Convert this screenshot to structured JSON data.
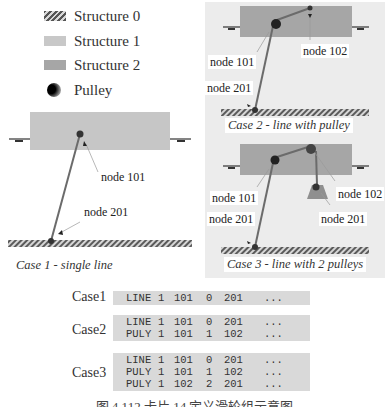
{
  "legend": {
    "items": [
      {
        "label": "Structure 0",
        "icon": "hatched-ground-swatch"
      },
      {
        "label": "Structure 1",
        "icon": "light-gray-swatch"
      },
      {
        "label": "Structure 2",
        "icon": "dark-gray-swatch"
      },
      {
        "label": "Pulley",
        "icon": "pulley-sphere-icon"
      }
    ]
  },
  "case1": {
    "title": "Case 1 - single line",
    "labels": {
      "node_top": "node 101",
      "node_bottom": "node 201"
    }
  },
  "case2": {
    "title": "Case 2 - line with pulley",
    "labels": {
      "node_pulley": "node 101",
      "node_end": "node 102",
      "node_bottom": "node 201"
    }
  },
  "case3": {
    "title": "Case 3 - line with 2 pulleys",
    "labels": {
      "node_pulley1": "node 101",
      "node_pulley2": "node 102",
      "node_bottom": "node 201",
      "node_weight": "node 201"
    }
  },
  "colors": {
    "structure1": "#c8c8c8",
    "structure2": "#a6a6a6",
    "panel_bg": "#ececec",
    "line": "#6b6b6b",
    "code_bg": "#d9d9d9"
  },
  "code_cases": [
    {
      "label": "Case1",
      "rows": [
        [
          "LINE",
          "1",
          "101",
          "0",
          "201",
          "..."
        ]
      ]
    },
    {
      "label": "Case2",
      "rows": [
        [
          "LINE",
          "1",
          "101",
          "0",
          "201",
          "..."
        ],
        [
          "PULY",
          "1",
          "101",
          "1",
          "102",
          "..."
        ]
      ]
    },
    {
      "label": "Case3",
      "rows": [
        [
          "LINE",
          "1",
          "101",
          "0",
          "201",
          "..."
        ],
        [
          "PULY",
          "1",
          "101",
          "1",
          "102",
          "..."
        ],
        [
          "PULY",
          "1",
          "102",
          "2",
          "201",
          "..."
        ]
      ]
    }
  ],
  "caption": "图 4.112  卡片 14  定义滑轮组示意图"
}
